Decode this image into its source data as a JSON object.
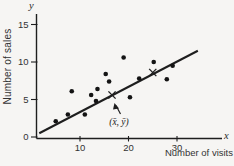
{
  "figure": {
    "background": "#f6f5f3",
    "ink_color": "#1e1e1e",
    "text_color": "#333333"
  },
  "chart_data": {
    "type": "scatter",
    "title": "",
    "xlabel": "Number of visits",
    "ylabel": "Number of sales",
    "x_axis_symbol": "x",
    "y_axis_symbol": "y",
    "x_ticks": [
      10,
      20,
      30
    ],
    "y_ticks": [
      0,
      5,
      10,
      15
    ],
    "xlim": [
      0,
      39
    ],
    "ylim": [
      0,
      16.4
    ],
    "grid": false,
    "legend": null,
    "points": [
      [
        5,
        2.1
      ],
      [
        7.5,
        3.0
      ],
      [
        8.3,
        6.1
      ],
      [
        11,
        3.0
      ],
      [
        12.3,
        5.6
      ],
      [
        13.3,
        4.8
      ],
      [
        13.6,
        6.4
      ],
      [
        15.3,
        8.4
      ],
      [
        16,
        7.4
      ],
      [
        19,
        10.6
      ],
      [
        20.3,
        5.3
      ],
      [
        22.2,
        7.8
      ],
      [
        25.2,
        10.0
      ],
      [
        27.9,
        7.7
      ],
      [
        29.1,
        9.5
      ]
    ],
    "regression_line": {
      "x1": 1.6,
      "y1": 0.5,
      "x2": 34.3,
      "y2": 11.5
    },
    "mean_point": {
      "x": 16.6,
      "y": 5.6,
      "label": "(x̄, ȳ)"
    },
    "second_cross": {
      "x": 25.0,
      "y": 8.6
    }
  }
}
